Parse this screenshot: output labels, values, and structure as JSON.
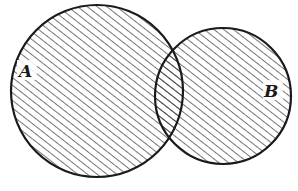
{
  "diagram": {
    "type": "venn",
    "colors": {
      "stroke": "#1a1a1a",
      "hatch": "#2a2a2a",
      "background": "#ffffff"
    },
    "sets": [
      {
        "id": "A",
        "label": "A",
        "shaded": true
      },
      {
        "id": "B",
        "label": "B",
        "shaded": true
      }
    ],
    "shading": "diagonal-hatch"
  }
}
